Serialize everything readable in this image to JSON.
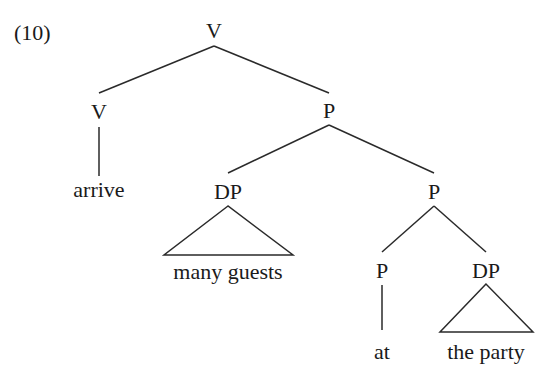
{
  "example_number": "(10)",
  "tree": {
    "root": {
      "label": "V",
      "x": 214,
      "y": 38
    },
    "nodes": {
      "v_left": {
        "label": "V",
        "x": 99,
        "y": 119
      },
      "p_mid": {
        "label": "P",
        "x": 329,
        "y": 118
      },
      "dp_left": {
        "label": "DP",
        "x": 228,
        "y": 199
      },
      "p_right": {
        "label": "P",
        "x": 434,
        "y": 199
      },
      "p_low": {
        "label": "P",
        "x": 382,
        "y": 278
      },
      "dp_low": {
        "label": "DP",
        "x": 486,
        "y": 278
      }
    },
    "leaves": {
      "arrive": {
        "text": "arrive",
        "x": 99,
        "y": 197
      },
      "many_guests": {
        "text": "many guests",
        "x": 228,
        "y": 279
      },
      "at": {
        "text": "at",
        "x": 382,
        "y": 359
      },
      "the_party": {
        "text": "the party",
        "x": 486,
        "y": 359
      }
    }
  }
}
